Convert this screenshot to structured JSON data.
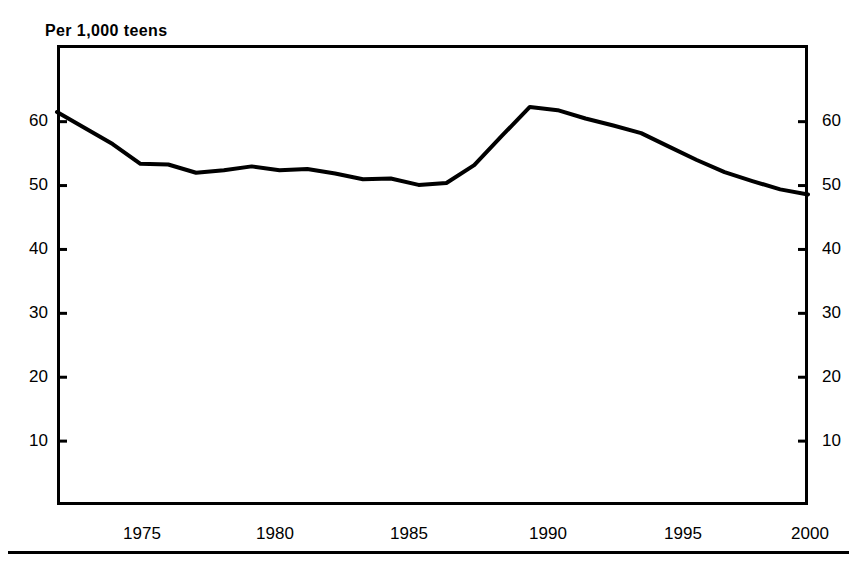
{
  "chart_title": "Per 1,000 teens",
  "axis": {
    "y_left_ticks": [
      "10",
      "20",
      "30",
      "40",
      "50",
      "60"
    ],
    "y_right_ticks": [
      "10",
      "20",
      "30",
      "40",
      "50",
      "60"
    ],
    "x_ticks": [
      "1975",
      "1980",
      "1985",
      "1990",
      "1995",
      "2000"
    ]
  },
  "style": {
    "line_color": "#000000",
    "frame_color": "#000000",
    "background": "#ffffff"
  },
  "chart_data": {
    "type": "line",
    "title": "Per 1,000 teens",
    "subtitle": "",
    "xlabel": "",
    "ylabel": "Per 1,000 teens",
    "xlim": [
      1973,
      2000
    ],
    "ylim": [
      0,
      72
    ],
    "grid": false,
    "legend": "none",
    "annotations": [],
    "y_tick_values": [
      10,
      20,
      30,
      40,
      50,
      60
    ],
    "x_tick_values": [
      1975,
      1980,
      1985,
      1990,
      1995,
      2000
    ],
    "x": [
      1973,
      1974,
      1975,
      1976,
      1977,
      1978,
      1979,
      1980,
      1981,
      1982,
      1983,
      1984,
      1985,
      1986,
      1987,
      1988,
      1989,
      1990,
      1991,
      1992,
      1993,
      1994,
      1995,
      1996,
      1997,
      1998,
      1999,
      2000
    ],
    "series": [
      {
        "name": "Teen birth rate",
        "values": [
          61.5,
          59.0,
          56.5,
          53.4,
          53.3,
          52.0,
          52.4,
          53.0,
          52.4,
          52.6,
          51.9,
          51.0,
          51.1,
          50.1,
          50.4,
          53.2,
          57.8,
          62.3,
          61.8,
          60.5,
          59.4,
          58.2,
          56.1,
          54.0,
          52.1,
          50.7,
          49.4,
          48.6
        ]
      }
    ]
  }
}
